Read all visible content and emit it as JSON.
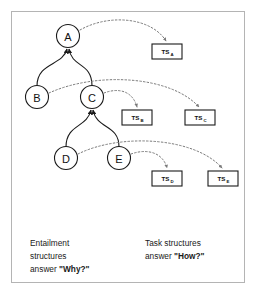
{
  "figure": {
    "nodes": [
      {
        "id": "A",
        "label": "A",
        "cx": 68,
        "cy": 36
      },
      {
        "id": "B",
        "label": "B",
        "cx": 37,
        "cy": 97
      },
      {
        "id": "C",
        "label": "C",
        "cx": 92,
        "cy": 97
      },
      {
        "id": "D",
        "label": "D",
        "cx": 66,
        "cy": 158
      },
      {
        "id": "E",
        "label": "E",
        "cx": 119,
        "cy": 158
      }
    ],
    "task_structures": [
      {
        "id": "TS_A",
        "main": "TS",
        "sub": "A",
        "x": 152,
        "y": 44,
        "w": 30,
        "h": 15
      },
      {
        "id": "TS_B",
        "main": "TS",
        "sub": "B",
        "x": 122,
        "y": 110,
        "w": 30,
        "h": 15
      },
      {
        "id": "TS_C",
        "main": "TS",
        "sub": "C",
        "x": 185,
        "y": 110,
        "w": 30,
        "h": 15
      },
      {
        "id": "TS_D",
        "main": "TS",
        "sub": "D",
        "x": 152,
        "y": 171,
        "w": 30,
        "h": 15
      },
      {
        "id": "TS_E",
        "main": "TS",
        "sub": "E",
        "x": 208,
        "y": 171,
        "w": 30,
        "h": 15
      }
    ],
    "tree_edges": [
      {
        "from": "B",
        "to": "A"
      },
      {
        "from": "C",
        "to": "A"
      },
      {
        "from": "D",
        "to": "C"
      },
      {
        "from": "E",
        "to": "C"
      }
    ],
    "task_links": [
      {
        "from": "A",
        "to": "TS_A"
      },
      {
        "from": "B",
        "to": "TS_C"
      },
      {
        "from": "C",
        "to": "TS_B"
      },
      {
        "from": "D",
        "to": "TS_E"
      },
      {
        "from": "E",
        "to": "TS_D"
      }
    ],
    "captions": {
      "entailment": {
        "line1": "Entailment",
        "line2": "structures",
        "line3_prefix": "answer ",
        "line3_emph": "\"Why?\""
      },
      "task": {
        "line1": "Task structures",
        "line2_prefix": "answer ",
        "line2_emph": "\"How?\""
      }
    },
    "colors": {
      "frame_border": "#b4b4b4",
      "node_stroke": "#1a1a1a",
      "arc_stroke": "#7a7a7a",
      "background": "#ffffff",
      "text": "#1a1a1a"
    }
  }
}
